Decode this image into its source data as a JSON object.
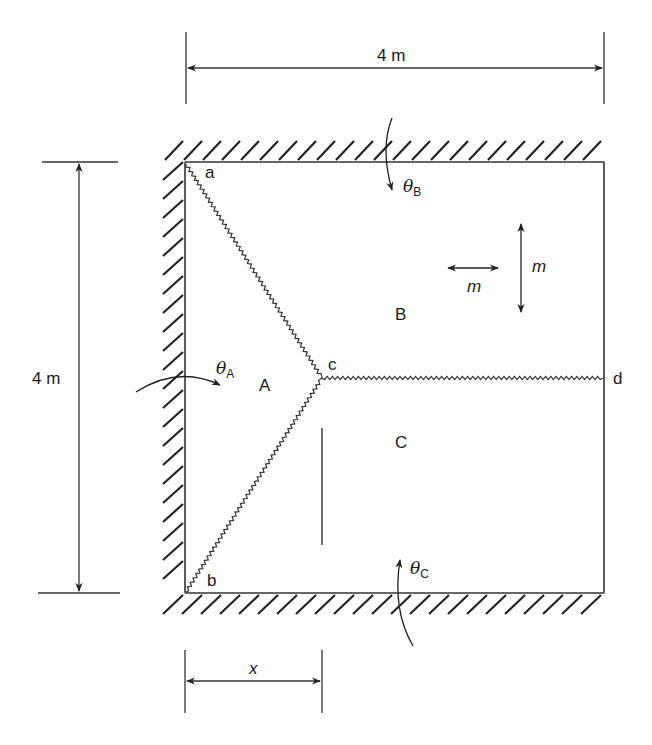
{
  "figure": {
    "type": "yield-line diagram of a slab",
    "line_color": "#333333",
    "dimensions": {
      "top_width": "4 m",
      "left_height": "4 m",
      "bottom_x": "x"
    },
    "points": {
      "a": "a",
      "b": "b",
      "c": "c",
      "d": "d"
    },
    "regions": {
      "A": "A",
      "B": "B",
      "C": "C"
    },
    "rotations": {
      "theta_a": {
        "symbol": "θ",
        "sub": "A"
      },
      "theta_b": {
        "symbol": "θ",
        "sub": "B"
      },
      "theta_c": {
        "symbol": "θ",
        "sub": "C"
      }
    },
    "moments": {
      "horizontal": "m",
      "vertical": "m"
    },
    "supports": [
      "top edge fixed",
      "left edge fixed",
      "bottom edge fixed",
      "right edge free"
    ],
    "yield_lines": [
      "a–c",
      "b–c",
      "c–d"
    ]
  }
}
